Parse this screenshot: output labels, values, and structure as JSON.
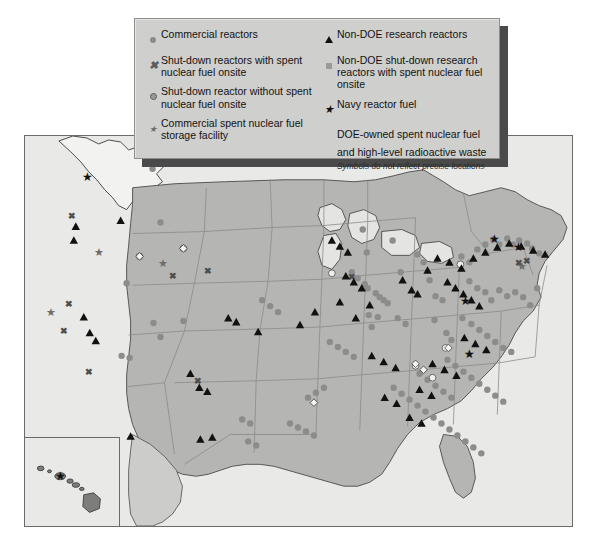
{
  "legend": {
    "left_items": [
      {
        "symbol": "dot-gray",
        "label": "Commercial reactors"
      },
      {
        "symbol": "x-mark",
        "label": "Shut-down reactors with spent nuclear fuel onsite"
      },
      {
        "symbol": "dot-ring",
        "label": "Shut-down reactor without spent nuclear fuel onsite"
      },
      {
        "symbol": "star-gray",
        "label": "Commercial spent nuclear fuel storage facility"
      }
    ],
    "right_items": [
      {
        "symbol": "triangle-black",
        "label": "Non-DOE research reactors"
      },
      {
        "symbol": "square-gray",
        "label": "Non-DOE shut-down research reactors with spent nuclear fuel onsite"
      },
      {
        "symbol": "star-black",
        "label": "Navy reactor fuel"
      },
      {
        "symbol": "none",
        "label": "DOE-owned spent nuclear fuel and high-level radioactive waste"
      }
    ],
    "note": "Symbols do not reflect precise locations"
  },
  "colors": {
    "land": "#b5b5b3",
    "water": "#e9e9e7",
    "legend_bg": "#cfcfcd",
    "legend_shadow": "#4a4a4a",
    "border": "#6b6b6b",
    "symbol_black": "#111111",
    "symbol_gray": "#8c8c8a",
    "symbol_white": "#f4f4f2",
    "state_line": "#8b8b89"
  },
  "map": {
    "title": "",
    "insets": [
      {
        "name": "alaska-inset",
        "label": ""
      },
      {
        "name": "hawaii-inset",
        "label": ""
      }
    ]
  },
  "markers": {
    "commercial_reactors": [
      [
        152,
        168
      ],
      [
        160,
        222
      ],
      [
        126,
        283
      ],
      [
        153,
        323
      ],
      [
        160,
        337
      ],
      [
        121,
        356
      ],
      [
        129,
        358
      ],
      [
        183,
        321
      ],
      [
        363,
        229
      ],
      [
        367,
        252
      ],
      [
        368,
        288
      ],
      [
        376,
        293
      ],
      [
        380,
        297
      ],
      [
        384,
        300
      ],
      [
        388,
        303
      ],
      [
        369,
        315
      ],
      [
        378,
        317
      ],
      [
        372,
        327
      ],
      [
        393,
        240
      ],
      [
        401,
        272
      ],
      [
        418,
        254
      ],
      [
        424,
        262
      ],
      [
        430,
        280
      ],
      [
        436,
        296
      ],
      [
        443,
        300
      ],
      [
        435,
        320
      ],
      [
        447,
        333
      ],
      [
        452,
        340
      ],
      [
        462,
        256
      ],
      [
        470,
        262
      ],
      [
        478,
        249
      ],
      [
        486,
        244
      ],
      [
        494,
        239
      ],
      [
        500,
        244
      ],
      [
        508,
        238
      ],
      [
        514,
        244
      ],
      [
        520,
        240
      ],
      [
        528,
        243
      ],
      [
        533,
        248
      ],
      [
        540,
        253
      ],
      [
        470,
        281
      ],
      [
        478,
        288
      ],
      [
        486,
        292
      ],
      [
        492,
        300
      ],
      [
        500,
        290
      ],
      [
        508,
        296
      ],
      [
        516,
        292
      ],
      [
        524,
        297
      ],
      [
        531,
        305
      ],
      [
        538,
        288
      ],
      [
        463,
        318
      ],
      [
        472,
        324
      ],
      [
        480,
        330
      ],
      [
        488,
        336
      ],
      [
        496,
        342
      ],
      [
        504,
        348
      ],
      [
        512,
        352
      ],
      [
        448,
        360
      ],
      [
        456,
        366
      ],
      [
        464,
        372
      ],
      [
        472,
        378
      ],
      [
        480,
        384
      ],
      [
        488,
        390
      ],
      [
        496,
        396
      ],
      [
        504,
        402
      ],
      [
        420,
        374
      ],
      [
        428,
        380
      ],
      [
        436,
        386
      ],
      [
        444,
        392
      ],
      [
        452,
        398
      ],
      [
        308,
        398
      ],
      [
        316,
        393
      ],
      [
        324,
        388
      ],
      [
        394,
        388
      ],
      [
        402,
        394
      ],
      [
        410,
        400
      ],
      [
        418,
        406
      ],
      [
        426,
        412
      ],
      [
        434,
        418
      ],
      [
        442,
        424
      ],
      [
        450,
        430
      ],
      [
        458,
        436
      ],
      [
        466,
        442
      ],
      [
        474,
        448
      ],
      [
        482,
        454
      ],
      [
        290,
        424
      ],
      [
        298,
        428
      ],
      [
        306,
        432
      ],
      [
        314,
        436
      ],
      [
        242,
        420
      ],
      [
        250,
        424
      ],
      [
        248,
        442
      ],
      [
        256,
        446
      ],
      [
        330,
        342
      ],
      [
        338,
        347
      ],
      [
        346,
        352
      ],
      [
        354,
        357
      ],
      [
        262,
        300
      ],
      [
        270,
        306
      ],
      [
        278,
        312
      ],
      [
        352,
        272
      ],
      [
        358,
        278
      ],
      [
        365,
        284
      ],
      [
        398,
        318
      ],
      [
        406,
        324
      ]
    ],
    "shutdown_with_fuel_x": [
      [
        71,
        215
      ],
      [
        68,
        303
      ],
      [
        63,
        330
      ],
      [
        88,
        372
      ],
      [
        173,
        275
      ],
      [
        208,
        270
      ],
      [
        352,
        276
      ],
      [
        520,
        262
      ],
      [
        528,
        260
      ],
      [
        198,
        381
      ]
    ],
    "shutdown_without_fuel": [
      [
        139,
        256
      ],
      [
        183,
        248
      ],
      [
        332,
        273
      ],
      [
        461,
        264
      ],
      [
        433,
        378
      ],
      [
        446,
        348
      ],
      [
        416,
        366
      ]
    ],
    "commercial_storage_star": [
      [
        98,
        251
      ],
      [
        50,
        312
      ],
      [
        163,
        262
      ],
      [
        470,
        354
      ],
      [
        523,
        265
      ]
    ],
    "research_reactors_triangle": [
      [
        75,
        226
      ],
      [
        73,
        240
      ],
      [
        120,
        220
      ],
      [
        236,
        322
      ],
      [
        228,
        318
      ],
      [
        83,
        317
      ],
      [
        89,
        333
      ],
      [
        95,
        341
      ],
      [
        190,
        374
      ],
      [
        199,
        388
      ],
      [
        207,
        392
      ],
      [
        130,
        437
      ],
      [
        200,
        440
      ],
      [
        212,
        438
      ],
      [
        258,
        332
      ],
      [
        300,
        325
      ],
      [
        315,
        312
      ],
      [
        340,
        302
      ],
      [
        356,
        318
      ],
      [
        370,
        305
      ],
      [
        403,
        280
      ],
      [
        412,
        290
      ],
      [
        418,
        294
      ],
      [
        428,
        270
      ],
      [
        438,
        258
      ],
      [
        346,
        276
      ],
      [
        354,
        282
      ],
      [
        362,
        288
      ],
      [
        448,
        282
      ],
      [
        456,
        288
      ],
      [
        464,
        294
      ],
      [
        472,
        300
      ],
      [
        480,
        306
      ],
      [
        450,
        262
      ],
      [
        462,
        268
      ],
      [
        474,
        258
      ],
      [
        486,
        252
      ],
      [
        498,
        247
      ],
      [
        510,
        243
      ],
      [
        522,
        246
      ],
      [
        534,
        250
      ],
      [
        546,
        254
      ],
      [
        465,
        338
      ],
      [
        476,
        344
      ],
      [
        487,
        350
      ],
      [
        433,
        364
      ],
      [
        445,
        370
      ],
      [
        457,
        376
      ],
      [
        420,
        390
      ],
      [
        432,
        396
      ],
      [
        410,
        418
      ],
      [
        422,
        424
      ],
      [
        385,
        398
      ],
      [
        397,
        404
      ],
      [
        372,
        356
      ],
      [
        384,
        362
      ],
      [
        396,
        368
      ],
      [
        332,
        240
      ],
      [
        340,
        246
      ],
      [
        348,
        252
      ]
    ],
    "navy_fuel_star_black": [
      [
        87,
        176
      ],
      [
        470,
        354
      ],
      [
        495,
        238
      ],
      [
        519,
        246
      ],
      [
        466,
        300
      ],
      [
        74,
        484
      ]
    ],
    "doe_sites_white_diamond": [
      [
        139,
        256
      ],
      [
        183,
        248
      ],
      [
        424,
        370
      ],
      [
        449,
        348
      ],
      [
        416,
        364
      ],
      [
        314,
        403
      ]
    ]
  }
}
